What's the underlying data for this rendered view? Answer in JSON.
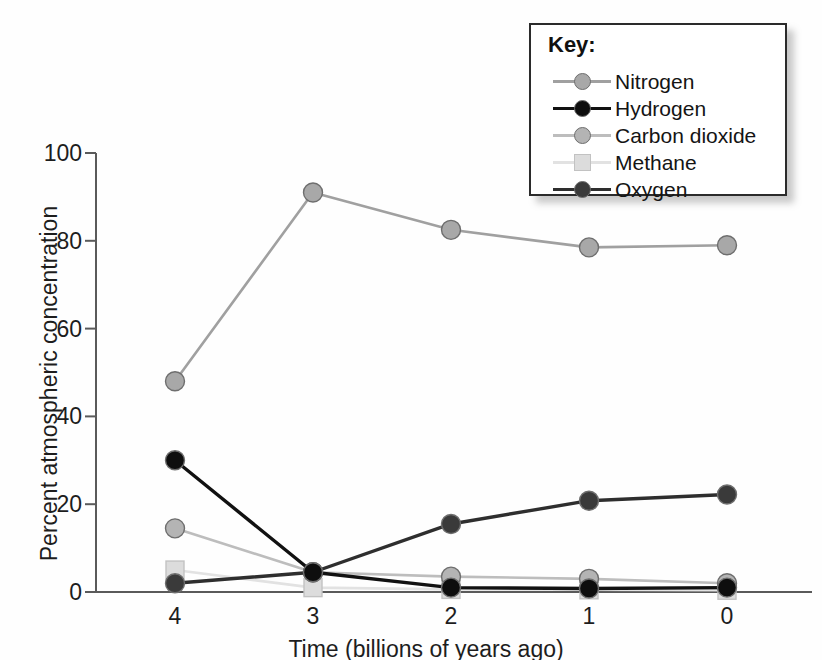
{
  "chart_data": {
    "type": "line",
    "title": "",
    "xlabel": "Time (billions of years ago)",
    "ylabel": "Percent atmospheric concentration",
    "x": [
      4,
      3,
      2,
      1,
      0
    ],
    "xtick_labels": [
      "4",
      "3",
      "2",
      "1",
      "0"
    ],
    "ytick_labels": [
      "0",
      "20",
      "40",
      "60",
      "80",
      "100"
    ],
    "yticks": [
      0,
      20,
      40,
      60,
      80,
      100
    ],
    "ylim": [
      0,
      100
    ],
    "xlim": [
      4,
      0
    ],
    "grid": false,
    "legend_position": "top-right",
    "legend_title": "Key:",
    "series": [
      {
        "name": "Nitrogen",
        "values": [
          48,
          91,
          82.5,
          78.5,
          79
        ],
        "color": "#a8a8a8",
        "line_color": "#a0a0a0",
        "marker": "circle"
      },
      {
        "name": "Hydrogen",
        "values": [
          30,
          4.5,
          1,
          0.8,
          1
        ],
        "color": "#0e0e0e",
        "line_color": "#111111",
        "marker": "circle"
      },
      {
        "name": "Carbon dioxide",
        "values": [
          14.5,
          4.5,
          3.5,
          3,
          2
        ],
        "color": "#b4b4b4",
        "line_color": "#bdbdbd",
        "marker": "circle"
      },
      {
        "name": "Methane",
        "values": [
          5,
          1,
          0.6,
          0.5,
          0.4
        ],
        "color": "#dcdcdc",
        "line_color": "#e2e2e2",
        "marker": "square"
      },
      {
        "name": "Oxygen",
        "values": [
          2,
          4.5,
          15.5,
          20.8,
          22.2
        ],
        "color": "#3a3a3a",
        "line_color": "#2e2e2e",
        "marker": "circle"
      }
    ]
  },
  "axes": {
    "y_title": "Percent atmospheric concentration",
    "x_title": "Time (billions of years ago)",
    "y_ticks": [
      {
        "label": "100",
        "value": 100
      },
      {
        "label": "80",
        "value": 80
      },
      {
        "label": "60",
        "value": 60
      },
      {
        "label": "40",
        "value": 40
      },
      {
        "label": "20",
        "value": 20
      },
      {
        "label": "0",
        "value": 0
      }
    ],
    "x_ticks": [
      {
        "label": "4",
        "value": 4
      },
      {
        "label": "3",
        "value": 3
      },
      {
        "label": "2",
        "value": 2
      },
      {
        "label": "1",
        "value": 1
      },
      {
        "label": "0",
        "value": 0
      }
    ],
    "axis_color": "#5a5a5a"
  },
  "legend": {
    "title": "Key:",
    "items": [
      {
        "label": "Nitrogen"
      },
      {
        "label": "Hydrogen"
      },
      {
        "label": "Carbon dioxide"
      },
      {
        "label": "Methane"
      },
      {
        "label": "Oxygen"
      }
    ]
  }
}
